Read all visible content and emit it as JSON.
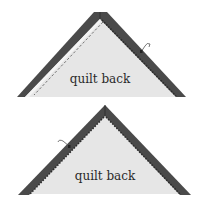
{
  "diagram": {
    "type": "quilt-binding-steps",
    "colors": {
      "background": "#ffffff",
      "quilt_fill": "#e6e6e6",
      "binding": "#4a4a4a",
      "binding_edge": "#2b2b2b",
      "stitch": "#555555",
      "thread": "#555555"
    },
    "panels": [
      {
        "id": "step-1",
        "label": "quilt back",
        "apex": [
          100,
          13
        ],
        "base_left": [
          17,
          97
        ],
        "base_right": [
          185,
          97
        ],
        "features": [
          "binding-left-folded",
          "dashed-stitch-line-left",
          "binding-right-stitched",
          "needle-thread-right"
        ]
      },
      {
        "id": "step-2",
        "label": "quilt back",
        "apex": [
          105,
          105
        ],
        "base_left": [
          18,
          195
        ],
        "base_right": [
          190,
          195
        ],
        "features": [
          "binding-left-stitched",
          "binding-right-stitched",
          "needle-thread-left"
        ]
      }
    ]
  }
}
